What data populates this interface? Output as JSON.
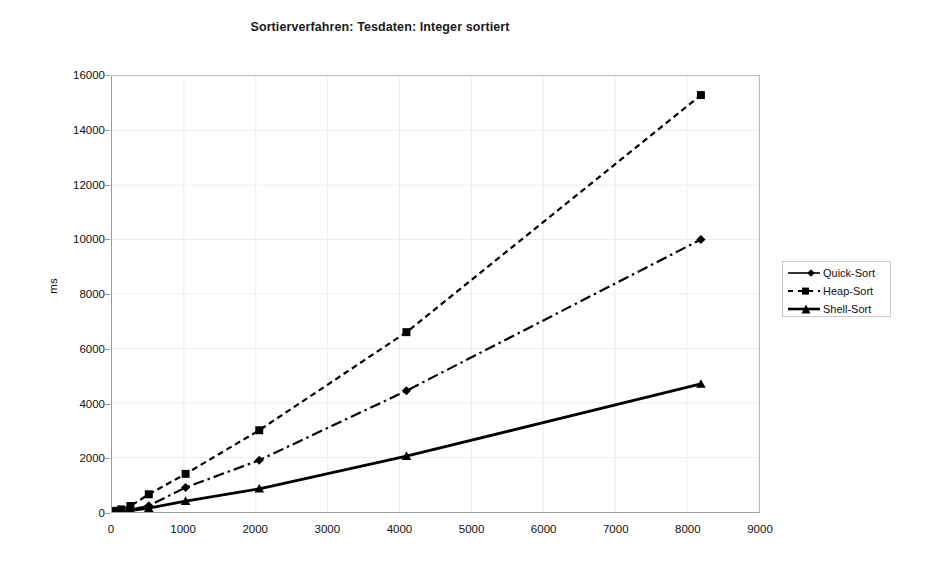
{
  "chart_data": {
    "type": "line",
    "title": "Sortierverfahren: Tesdaten: Integer sortiert",
    "xlabel": "",
    "ylabel": "ms",
    "xlim": [
      0,
      9000
    ],
    "ylim": [
      0,
      16000
    ],
    "xticks": [
      0,
      1000,
      2000,
      3000,
      4000,
      5000,
      6000,
      7000,
      8000,
      9000
    ],
    "yticks": [
      0,
      2000,
      4000,
      6000,
      8000,
      10000,
      12000,
      14000,
      16000
    ],
    "grid": true,
    "legend_position": "right",
    "x": [
      16,
      32,
      64,
      128,
      256,
      512,
      1024,
      2048,
      4096,
      8192
    ],
    "series": [
      {
        "name": "Quick-Sort",
        "marker": "diamond",
        "linestyle": "dash-dot",
        "color": "#000000",
        "values": [
          5,
          10,
          20,
          40,
          90,
          230,
          900,
          1900,
          4450,
          10000
        ]
      },
      {
        "name": "Heap-Sort",
        "marker": "square",
        "linestyle": "dashed",
        "color": "#000000",
        "values": [
          10,
          20,
          45,
          95,
          220,
          650,
          1400,
          3000,
          6600,
          15300
        ]
      },
      {
        "name": "Shell-Sort",
        "marker": "triangle",
        "linestyle": "solid",
        "color": "#000000",
        "values": [
          3,
          6,
          12,
          25,
          55,
          140,
          400,
          850,
          2050,
          4700
        ]
      }
    ]
  },
  "legend": {
    "entries": [
      {
        "label": "Quick-Sort"
      },
      {
        "label": "Heap-Sort"
      },
      {
        "label": "Shell-Sort"
      }
    ]
  }
}
